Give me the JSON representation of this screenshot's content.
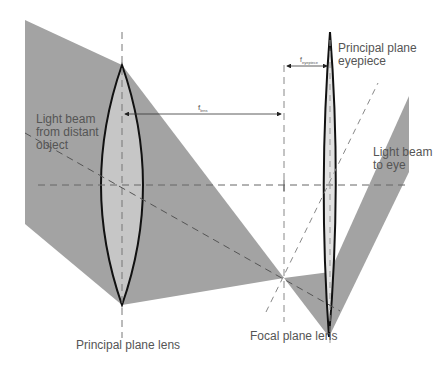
{
  "diagram": {
    "type": "optical-ray-diagram",
    "colors": {
      "background": "#ffffff",
      "beam": "#a3a3a3",
      "lens_fill": "#c6c6c6",
      "eyepiece_fill": "#e2e2e2",
      "lens_outline": "#111111",
      "dashed_line": "#666666",
      "text": "#555555"
    },
    "labels": {
      "light_beam_in_line1": "Light beam",
      "light_beam_in_line2": "from distant",
      "light_beam_in_line3": "object",
      "light_beam_out_line1": "Light beam",
      "light_beam_out_line2": "to eye",
      "principal_plane_eyepiece_line1": "Principal plane",
      "principal_plane_eyepiece_line2": "eyepiece",
      "principal_plane_lens": "Principal plane lens",
      "focal_plane_lens": "Focal plane lens",
      "f_lens_symbol": "f",
      "f_lens_subscript": "lens",
      "f_eyepiece_symbol": "f",
      "f_eyepiece_subscript": "eyepiece"
    },
    "elements": [
      {
        "name": "objective-lens",
        "kind": "biconvex lens",
        "top": [
          122,
          65
        ],
        "bottom": [
          122,
          305
        ]
      },
      {
        "name": "eyepiece-lens",
        "kind": "thin biconvex lens",
        "top": [
          330,
          32
        ],
        "bottom": [
          329,
          337
        ]
      },
      {
        "name": "optical-axis",
        "kind": "dashed line",
        "y": 185
      },
      {
        "name": "focal-point",
        "x": 284,
        "y": 278
      }
    ]
  }
}
